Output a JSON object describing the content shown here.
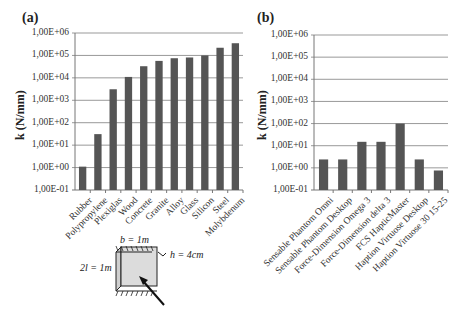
{
  "panels": {
    "a": {
      "label": "(a)"
    },
    "b": {
      "label": "(b)"
    }
  },
  "y_ticks": [
    "1,00E+06",
    "1,00E+05",
    "1,00E+04",
    "1,00E+03",
    "1,00E+02",
    "1,00E+01",
    "1,00E+00",
    "1,00E-01"
  ],
  "ylabel": "k (N/mm)",
  "diagram": {
    "b_label": "b = 1m",
    "h_label": "h = 4cm",
    "l_label": "2l = 1m"
  },
  "colors": {
    "bar": "#555555",
    "grid": "#999999",
    "axis": "#777777"
  },
  "chart_data": [
    {
      "type": "bar",
      "title": "(a)",
      "xlabel": "",
      "ylabel": "k (N/mm)",
      "yscale": "log",
      "ylim": [
        0.1,
        1000000
      ],
      "grid": true,
      "legend": null,
      "categories": [
        "Rubber",
        "Polypropylene",
        "Plexiglas",
        "Wood",
        "Concrete",
        "Granite",
        "Alloy",
        "Glass",
        "Silicon",
        "Steel",
        "Molybdenum"
      ],
      "values": [
        1.1,
        31,
        3100,
        11000,
        33000,
        57000,
        75000,
        81000,
        100000,
        220000,
        350000
      ]
    },
    {
      "type": "bar",
      "title": "(b)",
      "xlabel": "",
      "ylabel": "k (N/mm)",
      "yscale": "log",
      "ylim": [
        0.1,
        1000000
      ],
      "grid": true,
      "legend": null,
      "categories": [
        "Sensable Phantom Omni",
        "Sensable Phantom Desktop",
        "Force-Dimension Omega 3",
        "Force-Dimension delta 3",
        "FCS HapticMaster",
        "Haption Virtuose Desktop",
        "Haption Virtuose 30 15-25"
      ],
      "values": [
        2.4,
        2.4,
        15,
        15,
        100,
        2.4,
        0.76
      ]
    }
  ]
}
